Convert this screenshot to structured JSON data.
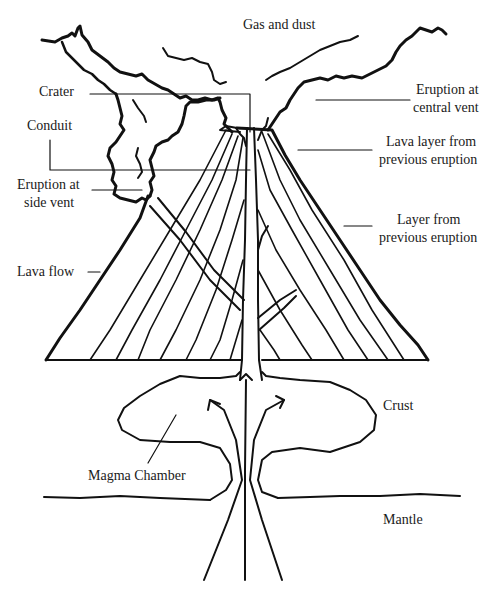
{
  "diagram": {
    "labels": {
      "gas_and_dust": "Gas and dust",
      "crater": "Crater",
      "conduit": "Conduit",
      "eruption_side_vent_line1": "Eruption at",
      "eruption_side_vent_line2": "side vent",
      "lava_flow": "Lava flow",
      "eruption_central_vent_line1": "Eruption at",
      "eruption_central_vent_line2": "central vent",
      "lava_layer_line1": "Lava layer from",
      "lava_layer_line2": "previous eruption",
      "layer_prev_line1": "Layer from",
      "layer_prev_line2": "previous eruption",
      "crust": "Crust",
      "magma_chamber": "Magma Chamber",
      "mantle": "Mantle"
    }
  }
}
